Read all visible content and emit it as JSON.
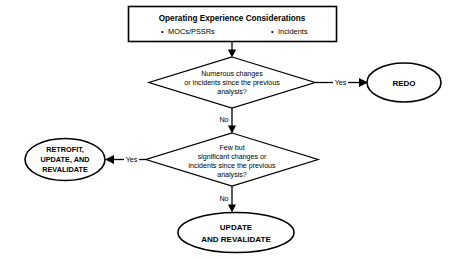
{
  "diagram": {
    "type": "flowchart",
    "title": "Operating Experience Considerations",
    "header": {
      "title": "Operating Experience Considerations",
      "bullets": [
        {
          "marker": "•",
          "label": "MOCs/PSSRs"
        },
        {
          "marker": "•",
          "label": "Incidents"
        }
      ]
    },
    "decisions": [
      {
        "id": "decision-numerous-changes",
        "lines": [
          "Numerous changes",
          "or incidents since the previous",
          "analysis?"
        ],
        "yes_label": "Yes",
        "no_label": "No"
      },
      {
        "id": "decision-few-but-significant",
        "lines": [
          "Few but",
          "significant changes or",
          "incidents since the previous",
          "analysis?"
        ],
        "yes_label": "Yes",
        "no_label": "No"
      }
    ],
    "terminals": [
      {
        "id": "terminal-redo",
        "lines": [
          "REDO"
        ]
      },
      {
        "id": "terminal-retrofit",
        "lines": [
          "RETROFIT,",
          "UPDATE, AND",
          "REVALIDATE"
        ]
      },
      {
        "id": "terminal-update",
        "lines": [
          "UPDATE",
          "AND  REVALIDATE"
        ]
      }
    ],
    "colors": {
      "background": "#ffffff",
      "stroke": "#000000",
      "text": "#000000"
    }
  }
}
